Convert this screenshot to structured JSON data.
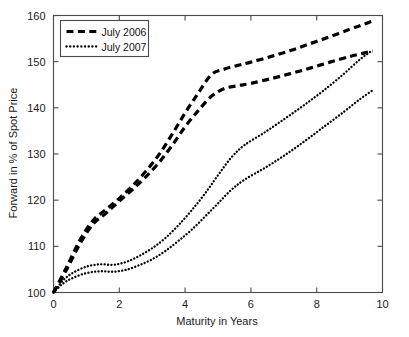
{
  "chart_data": {
    "type": "line",
    "title": "",
    "xlabel": "Maturity in Years",
    "ylabel": "Forward in % of Spot Price",
    "xlim": [
      0,
      10
    ],
    "ylim": [
      100,
      160
    ],
    "xticks": [
      0,
      2,
      4,
      6,
      8,
      10
    ],
    "yticks": [
      100,
      110,
      120,
      130,
      140,
      150,
      160
    ],
    "xtick_labels": [
      "0",
      "2",
      "4",
      "6",
      "8",
      "10"
    ],
    "ytick_labels": [
      "100",
      "110",
      "120",
      "130",
      "140",
      "150",
      "160"
    ],
    "grid": false,
    "legend_position": "upper left",
    "legend_entries": [
      {
        "label": "July 2006",
        "style": "dashed"
      },
      {
        "label": "July 2007",
        "style": "dotted"
      }
    ],
    "series": [
      {
        "name": "July 2006 upper",
        "group": "July 2006",
        "style": "dashed",
        "x": [
          0.0,
          0.4,
          0.8,
          1.2,
          1.6,
          2.0,
          2.4,
          2.8,
          3.2,
          3.6,
          4.0,
          4.4,
          4.8,
          5.2,
          5.6,
          6.0,
          6.6,
          7.2,
          7.8,
          8.4,
          9.0,
          9.4,
          9.7
        ],
        "y": [
          100.0,
          105.5,
          111.3,
          115.6,
          118.0,
          120.4,
          123.1,
          126.2,
          129.8,
          134.2,
          138.9,
          143.2,
          147.2,
          148.4,
          149.2,
          149.9,
          151.1,
          152.4,
          153.9,
          155.4,
          157.0,
          158.0,
          158.8
        ]
      },
      {
        "name": "July 2006 lower",
        "group": "July 2006",
        "style": "dashed",
        "x": [
          0.0,
          0.4,
          0.8,
          1.2,
          1.6,
          2.0,
          2.4,
          2.8,
          3.2,
          3.6,
          4.0,
          4.4,
          4.8,
          5.2,
          5.6,
          6.0,
          6.6,
          7.2,
          7.8,
          8.4,
          9.0,
          9.4,
          9.7
        ],
        "y": [
          100.0,
          105.0,
          110.5,
          114.8,
          117.2,
          119.8,
          122.3,
          125.0,
          128.1,
          131.8,
          135.9,
          139.4,
          142.5,
          144.2,
          144.8,
          145.3,
          146.3,
          147.4,
          148.6,
          149.9,
          151.1,
          151.8,
          152.3
        ]
      },
      {
        "name": "July 2007 upper",
        "group": "July 2007",
        "style": "dotted",
        "x": [
          0.0,
          0.3,
          0.6,
          1.0,
          1.4,
          1.8,
          2.2,
          2.6,
          3.0,
          3.4,
          3.8,
          4.2,
          4.6,
          5.0,
          5.4,
          5.8,
          6.4,
          7.0,
          7.6,
          8.2,
          8.8,
          9.3,
          9.7
        ],
        "y": [
          100.0,
          102.7,
          104.3,
          105.6,
          106.1,
          106.0,
          106.6,
          107.9,
          109.6,
          111.8,
          114.6,
          117.8,
          121.4,
          125.4,
          129.2,
          131.9,
          134.6,
          137.5,
          140.5,
          143.7,
          147.2,
          150.4,
          152.5
        ]
      },
      {
        "name": "July 2007 lower",
        "group": "July 2007",
        "style": "dotted",
        "x": [
          0.0,
          0.3,
          0.6,
          1.0,
          1.4,
          1.8,
          2.2,
          2.6,
          3.0,
          3.4,
          3.8,
          4.2,
          4.6,
          5.0,
          5.4,
          5.8,
          6.4,
          7.0,
          7.6,
          8.2,
          8.8,
          9.3,
          9.7
        ],
        "y": [
          100.0,
          102.0,
          103.2,
          104.2,
          104.6,
          104.5,
          104.9,
          105.9,
          107.2,
          109.0,
          111.2,
          113.6,
          116.4,
          119.3,
          122.2,
          124.4,
          126.9,
          129.6,
          132.6,
          135.8,
          139.0,
          141.8,
          143.8
        ]
      }
    ]
  },
  "style": {
    "line_color": "#000000",
    "axis_color": "#4a4a4a",
    "background": "#ffffff"
  }
}
